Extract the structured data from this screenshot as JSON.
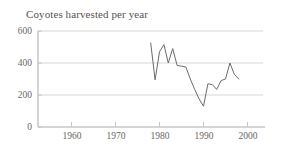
{
  "chart_data": {
    "type": "line",
    "title": "Coyotes harvested per year",
    "xlabel": "",
    "ylabel": "",
    "xlim": [
      1955,
      2000
    ],
    "ylim": [
      0,
      600
    ],
    "grid": true,
    "grid_axis": "y",
    "legend": "none",
    "xticks": [
      1960,
      1970,
      1980,
      1990,
      2000
    ],
    "xtick_labels": [
      "1960",
      "1970",
      "1980",
      "1990",
      "2000"
    ],
    "yticks": [
      0,
      200,
      400,
      600
    ],
    "ytick_labels": [
      "0",
      "200",
      "400",
      "600"
    ],
    "line_color": "#6b6b6b",
    "series": [
      {
        "name": "Coyotes harvested per year",
        "x": [
          1978,
          1979,
          1980,
          1981,
          1982,
          1983,
          1984,
          1985,
          1986,
          1987,
          1988,
          1989,
          1990,
          1991,
          1992,
          1993,
          1994,
          1995,
          1996,
          1997,
          1998
        ],
        "values": [
          525,
          295,
          470,
          515,
          400,
          490,
          385,
          380,
          375,
          300,
          235,
          175,
          130,
          270,
          265,
          235,
          290,
          300,
          400,
          330,
          300
        ]
      }
    ]
  },
  "axes": {
    "y_axis_label_top": "600",
    "y_axis_label_mid_high": "400",
    "y_axis_label_mid_low": "200",
    "y_axis_label_zero": "0"
  }
}
